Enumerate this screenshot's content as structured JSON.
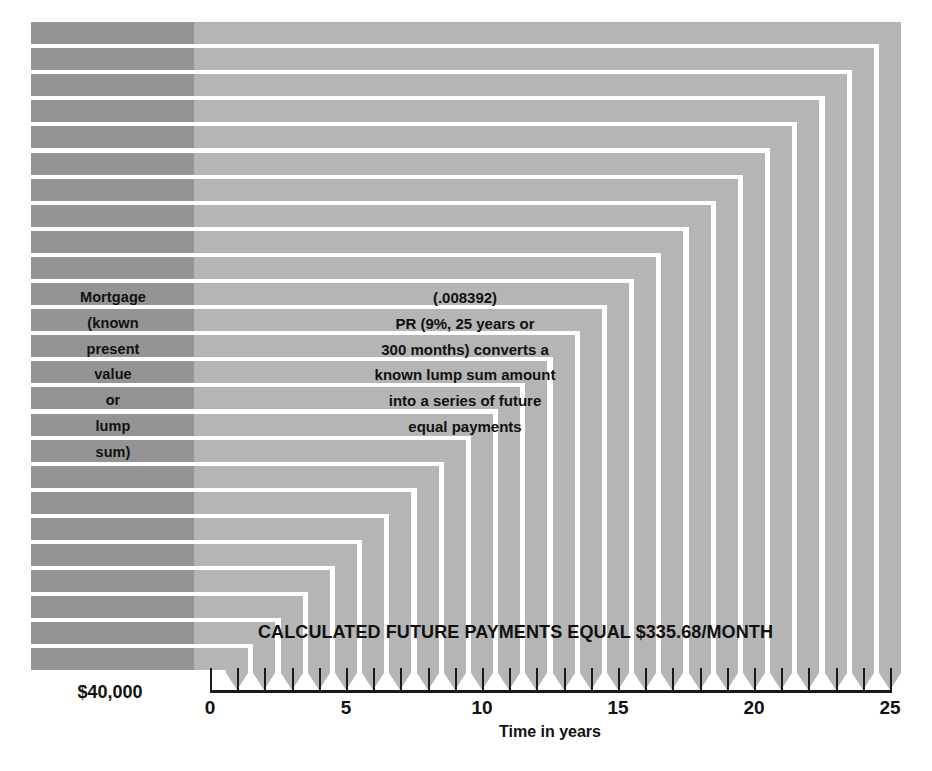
{
  "diagram": {
    "left_block": {
      "lines": [
        "Mortgage",
        "(known",
        "present",
        "value",
        "or",
        "lump",
        "sum)"
      ],
      "amount_label": "$40,000",
      "color": "#949494"
    },
    "center_note": {
      "lines": [
        "(.008392)",
        "PR (9%, 25 years or",
        "300 months) converts a",
        "known lump sum amount",
        "into a series of future",
        "equal payments"
      ]
    },
    "caption": "CALCULATED FUTURE PAYMENTS EQUAL $335.68/MONTH",
    "axis": {
      "title": "Time in years",
      "tick_labels": [
        "0",
        "5",
        "10",
        "15",
        "20",
        "25"
      ],
      "tick_values": [
        0,
        5,
        10,
        15,
        20,
        25
      ],
      "min": 0,
      "max": 25,
      "tick_count": 26,
      "line_color": "#1a1a1a"
    },
    "bars": {
      "count": 25,
      "fill_color": "#b5b5b5",
      "arrow_direction": "down"
    }
  },
  "chart_data": {
    "type": "bar",
    "xlabel": "Time in years",
    "ylabel": "",
    "xlim": [
      0,
      25
    ],
    "grid": false,
    "legend": "none",
    "categories": [
      "1",
      "2",
      "3",
      "4",
      "5",
      "6",
      "7",
      "8",
      "9",
      "10",
      "11",
      "12",
      "13",
      "14",
      "15",
      "16",
      "17",
      "18",
      "19",
      "20",
      "21",
      "22",
      "23",
      "24",
      "25"
    ],
    "values": [
      335.68,
      335.68,
      335.68,
      335.68,
      335.68,
      335.68,
      335.68,
      335.68,
      335.68,
      335.68,
      335.68,
      335.68,
      335.68,
      335.68,
      335.68,
      335.68,
      335.68,
      335.68,
      335.68,
      335.68,
      335.68,
      335.68,
      335.68,
      335.68,
      335.68
    ],
    "annotations": [
      "(.008392)",
      "PR (9%, 25 years or 300 months) converts a known lump sum amount into a series of future equal payments",
      "CALCULATED FUTURE PAYMENTS EQUAL $335.68/MONTH",
      "$40,000"
    ],
    "present_value": 40000,
    "payment": 335.68,
    "interest_rate": "9%",
    "term_years": 25,
    "term_months": 300,
    "pr_factor": 0.008392
  }
}
